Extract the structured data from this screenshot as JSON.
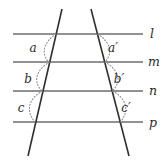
{
  "figure": {
    "background_color": "#ffffff",
    "parallel_line_color": "#6d6d6d",
    "transversal_color": "#2f2f2f",
    "arc_color": "#8d8d8d",
    "label_color": "#2b2b2b",
    "parallel_lines": [
      {
        "id": "l",
        "label": "l",
        "y": 34,
        "x_start": 13,
        "x_end": 143,
        "label_x": 150,
        "label_y": 38
      },
      {
        "id": "m",
        "label": "m",
        "y": 62,
        "x_start": 13,
        "x_end": 143,
        "label_x": 148,
        "label_y": 66
      },
      {
        "id": "n",
        "label": "n",
        "y": 91,
        "x_start": 13,
        "x_end": 143,
        "label_x": 149,
        "label_y": 95
      },
      {
        "id": "p",
        "label": "p",
        "y": 122,
        "x_start": 13,
        "x_end": 143,
        "label_x": 149,
        "label_y": 127
      }
    ],
    "transversals": [
      {
        "id": "left",
        "x1": 62,
        "y1": 9,
        "x2": 28,
        "y2": 156
      },
      {
        "id": "right",
        "x1": 91,
        "y1": 9,
        "x2": 129,
        "y2": 156
      }
    ],
    "angles": [
      {
        "id": "a",
        "label": "a",
        "transversal": "left",
        "between_lines": [
          "l",
          "m"
        ],
        "label_x": 33,
        "label_y": 52,
        "arc_path": "M 56.2 34 C 45 41 40 52 48.5 62"
      },
      {
        "id": "b",
        "label": "b",
        "transversal": "left",
        "between_lines": [
          "m",
          "n"
        ],
        "label_x": 28,
        "label_y": 83,
        "arc_path": "M 49.7 62 C 37 69 32 81 42 91"
      },
      {
        "id": "c",
        "label": "c",
        "transversal": "left",
        "between_lines": [
          "n",
          "p"
        ],
        "label_x": 21,
        "label_y": 112,
        "arc_path": "M 42.5 91 C 29 98 25 111 35 122"
      },
      {
        "id": "a-prime",
        "label": "a′",
        "transversal": "right",
        "between_lines": [
          "l",
          "m"
        ],
        "label_x": 113,
        "label_y": 52,
        "arc_path": "M 97.5 34 C 109 41 114 52 105 62"
      },
      {
        "id": "b-prime",
        "label": "b′",
        "transversal": "right",
        "between_lines": [
          "m",
          "n"
        ],
        "label_x": 119,
        "label_y": 83,
        "arc_path": "M 104.8 62 C 118 69 123 81 112 91"
      },
      {
        "id": "c-prime",
        "label": "c′",
        "transversal": "right",
        "between_lines": [
          "n",
          "p"
        ],
        "label_x": 126,
        "label_y": 112,
        "arc_path": "M 112.5 91 C 126 98 130 110 120.5 122"
      }
    ]
  }
}
